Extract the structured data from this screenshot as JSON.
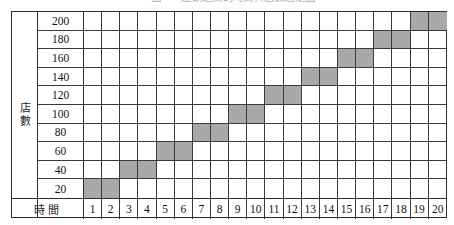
{
  "figure": {
    "caption": "圖一　連鎖超商的時間與店數之走圖",
    "y_axis_title": "店數",
    "x_axis_title": "時間"
  },
  "style": {
    "fill_color": "#a9a9a9",
    "grid_line_color": "#3a3a3a",
    "frame_color": "#2c2c2c",
    "background": "#ffffff"
  },
  "chart_data": {
    "type": "bar",
    "title": "圖一　連鎖超商的時間與店數之走圖",
    "xlabel": "時間",
    "ylabel": "店數",
    "grid": true,
    "legend": null,
    "categories": [
      1,
      2,
      3,
      4,
      5,
      6,
      7,
      8,
      9,
      10,
      11,
      12,
      13,
      14,
      15,
      16,
      17,
      18,
      19,
      20
    ],
    "values": [
      20,
      20,
      40,
      40,
      60,
      60,
      80,
      80,
      100,
      100,
      120,
      120,
      140,
      140,
      160,
      160,
      180,
      180,
      200,
      200
    ],
    "x_tick_labels": [
      "1",
      "2",
      "3",
      "4",
      "5",
      "6",
      "7",
      "8",
      "9",
      "10",
      "11",
      "12",
      "13",
      "14",
      "15",
      "16",
      "17",
      "18",
      "19",
      "20"
    ],
    "y_tick_labels": [
      "200",
      "180",
      "160",
      "140",
      "120",
      "100",
      "80",
      "60",
      "40",
      "20"
    ],
    "y_tick_values_top_to_bottom": [
      200,
      180,
      160,
      140,
      120,
      100,
      80,
      60,
      40,
      20
    ],
    "ylim": [
      0,
      200
    ],
    "xlim": [
      1,
      20
    ],
    "y_step": 20,
    "filled_cells_row_major_top_to_bottom": [
      {
        "row_value": 200,
        "columns": [
          19,
          20
        ]
      },
      {
        "row_value": 180,
        "columns": [
          17,
          18
        ]
      },
      {
        "row_value": 160,
        "columns": [
          15,
          16
        ]
      },
      {
        "row_value": 140,
        "columns": [
          13,
          14
        ]
      },
      {
        "row_value": 120,
        "columns": [
          11,
          12
        ]
      },
      {
        "row_value": 100,
        "columns": [
          9,
          10
        ]
      },
      {
        "row_value": 80,
        "columns": [
          7,
          8
        ]
      },
      {
        "row_value": 60,
        "columns": [
          5,
          6
        ]
      },
      {
        "row_value": 40,
        "columns": [
          3,
          4
        ]
      },
      {
        "row_value": 20,
        "columns": [
          1,
          2
        ]
      }
    ]
  }
}
